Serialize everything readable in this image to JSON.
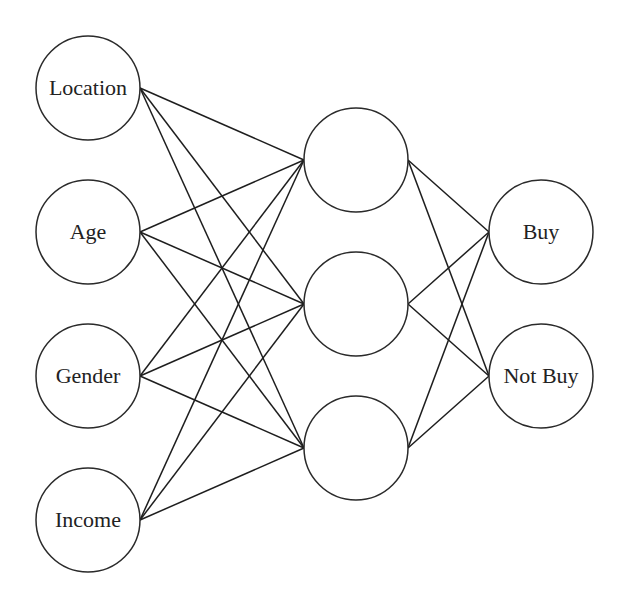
{
  "diagram": {
    "type": "neural-network",
    "colors": {
      "stroke": "#2a2a2a",
      "background": "#ffffff",
      "text": "#222222"
    },
    "layers": {
      "input": [
        {
          "id": "in0",
          "label": "Location",
          "cx": 88,
          "cy": 88
        },
        {
          "id": "in1",
          "label": "Age",
          "cx": 88,
          "cy": 232
        },
        {
          "id": "in2",
          "label": "Gender",
          "cx": 88,
          "cy": 376
        },
        {
          "id": "in3",
          "label": "Income",
          "cx": 88,
          "cy": 520
        }
      ],
      "hidden": [
        {
          "id": "h0",
          "label": "",
          "cx": 356,
          "cy": 160
        },
        {
          "id": "h1",
          "label": "",
          "cx": 356,
          "cy": 304
        },
        {
          "id": "h2",
          "label": "",
          "cx": 356,
          "cy": 448
        }
      ],
      "output": [
        {
          "id": "out0",
          "label": "Buy",
          "cx": 541,
          "cy": 232
        },
        {
          "id": "out1",
          "label": "Not Buy",
          "cx": 541,
          "cy": 376
        }
      ]
    },
    "radius": 52
  }
}
